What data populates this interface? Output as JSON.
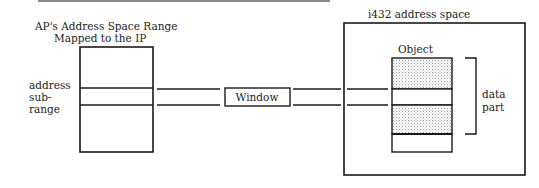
{
  "diagram": {
    "left_title_line1": "AP's Address Space Range",
    "left_title_line2": "Mapped to the IP",
    "subrange_label": [
      "address",
      "sub-",
      "range"
    ],
    "window_label": "Window",
    "right_title": "i432 address space",
    "object_label": "Object",
    "data_part_label": [
      "data",
      "part"
    ]
  },
  "colors": {
    "ink": "#1a1a1a",
    "rule": "#8a8a8a",
    "stipple": "#cfcfcf"
  }
}
